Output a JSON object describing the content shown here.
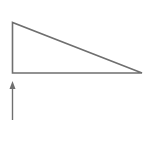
{
  "diagram": {
    "stroke_color": "#6f6f6f",
    "background": "#ffffff",
    "shapes": [
      {
        "type": "right-triangle",
        "points": [
          [
            12,
            22
          ],
          [
            12,
            73
          ],
          [
            142,
            73
          ]
        ]
      },
      {
        "type": "arrow",
        "from": [
          12,
          120
        ],
        "to": [
          12,
          81
        ],
        "direction": "up"
      }
    ]
  }
}
